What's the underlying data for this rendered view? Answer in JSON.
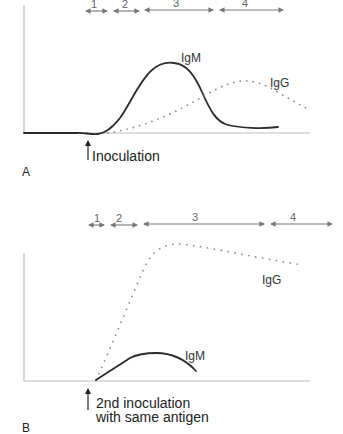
{
  "panels": [
    {
      "id": "A",
      "label": "A",
      "phases": [
        "1",
        "2",
        "3",
        "4"
      ],
      "curves": {
        "igm_label": "IgM",
        "igg_label": "IgG"
      },
      "event_label": [
        "Inoculation"
      ]
    },
    {
      "id": "B",
      "label": "B",
      "phases": [
        "1",
        "2",
        "3",
        "4"
      ],
      "curves": {
        "igm_label": "IgM",
        "igg_label": "IgG"
      },
      "event_label": [
        "2nd inoculation",
        "with same antigen"
      ]
    }
  ],
  "colors": {
    "igm": "#2b2b2b",
    "igg": "#8a8a8a",
    "axis": "#bdbdbd",
    "phase_arrow": "#777777"
  }
}
